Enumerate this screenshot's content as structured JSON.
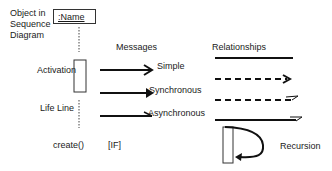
{
  "legend": {
    "object_label": [
      "Object in",
      "Sequence",
      "Diagram"
    ],
    "object_name": ":Name",
    "activation_label": "Activation",
    "lifeline_label": "Life Line",
    "messages_heading": "Messages",
    "relationships_heading": "Relationships",
    "messages": [
      {
        "label": "Simple",
        "arrow": "open-arrowhead"
      },
      {
        "label": "Synchronous",
        "arrow": "filled-arrowhead"
      },
      {
        "label": "Asynchronous",
        "arrow": "half-arrowhead"
      }
    ],
    "relationships": [
      {
        "style": "solid-line"
      },
      {
        "style": "dashed-open-arrow"
      },
      {
        "style": "dashed-half-arrow"
      },
      {
        "style": "solid-half-arrow"
      }
    ],
    "create_label": "create()",
    "condition_label": "[IF]",
    "recursion_label": "Recursion"
  }
}
